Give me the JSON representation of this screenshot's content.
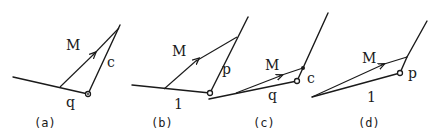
{
  "panels": [
    {
      "id": "a",
      "caption": "(a)",
      "arrow_label": "M",
      "upper_label": "c",
      "lower_label": "q"
    },
    {
      "id": "b",
      "caption": "(b)",
      "arrow_label": "M",
      "upper_label": "p",
      "lower_label": "1"
    },
    {
      "id": "c",
      "caption": "(c)",
      "arrow_label": "M",
      "upper_label": "c",
      "lower_label": "q"
    },
    {
      "id": "d",
      "caption": "(d)",
      "arrow_label": "M",
      "upper_label": "p",
      "lower_label": "1"
    }
  ],
  "colors": {
    "ink": "#1a1a1a",
    "background": "#ffffff"
  }
}
